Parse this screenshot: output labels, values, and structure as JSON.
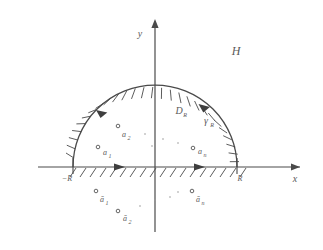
{
  "figure": {
    "name": "semicircular-contour-upper-half-plane",
    "axes": {
      "x_label": "x",
      "y_label": "y"
    },
    "colors": {
      "stroke": "#4a4a4a",
      "label": "#5a5a5a",
      "background": "#ffffff",
      "pole_marker": "#555555"
    },
    "labels": {
      "half_plane": "H",
      "region": "D",
      "region_sub": "R",
      "arc": "γ",
      "arc_sub": "R",
      "right_endpoint": "R",
      "left_endpoint": "−R"
    },
    "poles_upper": [
      {
        "label": "a",
        "sub": "1",
        "cx": 98,
        "cy": 147
      },
      {
        "label": "a",
        "sub": "2",
        "cx": 111,
        "cy": 126
      },
      {
        "label": "a",
        "sub": "n",
        "cx": 193,
        "cy": 148
      }
    ],
    "poles_lower": [
      {
        "label": "ā",
        "sub": "1",
        "cx": 96,
        "cy": 191
      },
      {
        "label": "ā",
        "sub": "2",
        "cx": 118,
        "cy": 211
      },
      {
        "label": "ā",
        "sub": "n",
        "cx": 192,
        "cy": 191
      }
    ],
    "ellipsis_upper": [
      {
        "cx": 145,
        "cy": 134
      },
      {
        "cx": 163,
        "cy": 139
      },
      {
        "cx": 178,
        "cy": 143
      },
      {
        "cx": 152,
        "cy": 146
      }
    ],
    "ellipsis_lower": [
      {
        "cx": 140,
        "cy": 206
      },
      {
        "cx": 155,
        "cy": 200
      },
      {
        "cx": 170,
        "cy": 197
      },
      {
        "cx": 178,
        "cy": 192
      }
    ],
    "geometry": {
      "origin_x": 155,
      "origin_y": 167,
      "radius_px": 82,
      "arc_left_x": 73,
      "arc_right_x": 237
    }
  }
}
